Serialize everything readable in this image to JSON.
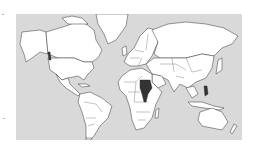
{
  "map": {
    "type": "world-choropleth",
    "projection": "mercator",
    "colors": {
      "ocean": "#d9d9d9",
      "land": "#ffffff",
      "border": "#333333",
      "highlight": "#333333"
    },
    "highlighted_regions": [
      {
        "name": "Sudan / South Sudan",
        "continent": "Africa"
      },
      {
        "name": "Uganda",
        "continent": "Africa"
      },
      {
        "name": "Philippines",
        "continent": "Asia"
      },
      {
        "name": "Pacific Northwest coast",
        "continent": "North America"
      }
    ]
  }
}
